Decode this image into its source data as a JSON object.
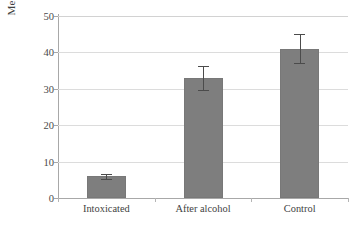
{
  "chart_data": {
    "type": "bar",
    "title": "",
    "subtitle": "",
    "xlabel": "",
    "ylabel": "Mean time off treadmill in seconds",
    "ylabel_lines": [
      "Mean time off treadmill in",
      "seconds"
    ],
    "categories": [
      "Intoxicated",
      "After alcohol",
      "Control"
    ],
    "values": [
      6,
      33,
      41
    ],
    "errors": [
      0.7,
      3.2,
      4.0
    ],
    "ylim": [
      0,
      50
    ],
    "yticks": [
      0,
      10,
      20,
      30,
      40,
      50
    ],
    "ytick_labels": [
      "0",
      "10",
      "20",
      "30",
      "40",
      "50"
    ],
    "grid": "horizontal",
    "legend": "none",
    "error_bar_type": "symmetric",
    "bar_color": "#7e7e7e",
    "gridline_color": "#dcdcdc",
    "axis_color": "#a8a8a8",
    "error_bar_color": "#4b4b4b",
    "background_color": "#ffffff"
  }
}
